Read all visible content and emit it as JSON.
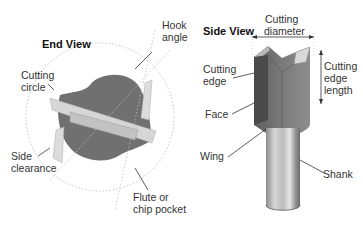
{
  "end_view": {
    "title": "End View",
    "labels": {
      "hook_angle_1": "Hook",
      "hook_angle_2": "angle",
      "cutting_circle_1": "Cutting",
      "cutting_circle_2": "circle",
      "side_clearance_1": "Side",
      "side_clearance_2": "clearance",
      "flute_1": "Flute or",
      "flute_2": "chip pocket"
    }
  },
  "side_view": {
    "title": "Side View",
    "labels": {
      "cutting_diameter_1": "Cutting",
      "cutting_diameter_2": "diameter",
      "cutting_edge_1": "Cutting",
      "cutting_edge_2": "edge",
      "cutting_edge_length_1": "Cutting",
      "cutting_edge_length_2": "edge",
      "cutting_edge_length_3": "length",
      "face": "Face",
      "wing": "Wing",
      "shank": "Shank"
    }
  },
  "colors": {
    "body_dark": "#6e6e6e",
    "body_mid": "#8a8a8a",
    "carbide_light": "#d9d9d9",
    "shank_light": "#c8c8c8",
    "leader": "#333333",
    "dotted": "#bbbbbb"
  }
}
